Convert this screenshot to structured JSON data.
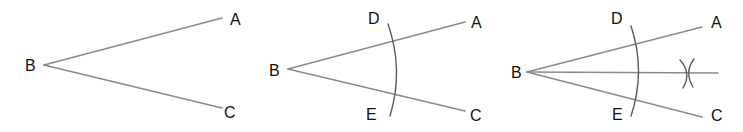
{
  "diagram": {
    "colors": {
      "lines": "#8a8a8a",
      "arcs": "#5a5a5a",
      "labels": "#111111",
      "background": "#ffffff"
    },
    "panels": [
      {
        "step": 1,
        "description": "Given angle ABC",
        "labels": {
          "A": "A",
          "B": "B",
          "C": "C"
        }
      },
      {
        "step": 2,
        "description": "Arc centered at B cuts BA at D and BC at E",
        "labels": {
          "A": "A",
          "B": "B",
          "C": "C",
          "D": "D",
          "E": "E"
        }
      },
      {
        "step": 3,
        "description": "Arcs from D and E intersect; line from B through intersection bisects angle",
        "labels": {
          "A": "A",
          "B": "B",
          "C": "C",
          "D": "D",
          "E": "E"
        }
      }
    ]
  }
}
